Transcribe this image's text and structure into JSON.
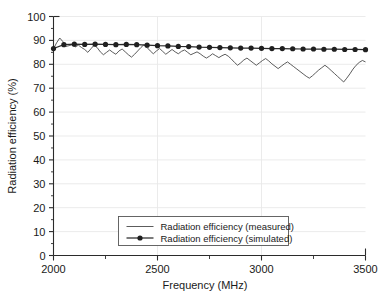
{
  "chart_data": {
    "type": "line",
    "title": "",
    "xlabel": "Frequency (MHz)",
    "ylabel": "Radiation efficiency (%)",
    "xlim": [
      2000,
      3500
    ],
    "ylim": [
      0,
      100
    ],
    "xticks": [
      2000,
      2500,
      3000,
      3500
    ],
    "xtick_labels": [
      "2000",
      "2500",
      "3000",
      "3500"
    ],
    "xminorticks": [
      2250,
      2750,
      3250
    ],
    "yticks": [
      0,
      10,
      20,
      30,
      40,
      50,
      60,
      70,
      80,
      90,
      100
    ],
    "ytick_labels": [
      "0",
      "10",
      "20",
      "30",
      "40",
      "50",
      "60",
      "70",
      "80",
      "90",
      "100"
    ],
    "grid": "light vertical gridlines at x majors, light horizontal gridlines at y majors",
    "legend_position": "lower center inside axes",
    "series": [
      {
        "name": "Radiation efficiency (measured)",
        "style": "thin solid line, no markers",
        "color": "#4a4a4a",
        "x": [
          2000,
          2015,
          2030,
          2045,
          2060,
          2075,
          2090,
          2105,
          2120,
          2135,
          2150,
          2165,
          2180,
          2195,
          2210,
          2225,
          2240,
          2255,
          2270,
          2285,
          2300,
          2315,
          2330,
          2345,
          2360,
          2375,
          2390,
          2405,
          2420,
          2435,
          2450,
          2465,
          2480,
          2495,
          2510,
          2525,
          2540,
          2555,
          2570,
          2585,
          2600,
          2615,
          2630,
          2645,
          2660,
          2675,
          2690,
          2705,
          2720,
          2735,
          2750,
          2765,
          2780,
          2795,
          2810,
          2825,
          2840,
          2855,
          2870,
          2885,
          2900,
          2915,
          2930,
          2945,
          2960,
          2975,
          2990,
          3005,
          3020,
          3035,
          3050,
          3065,
          3080,
          3095,
          3110,
          3125,
          3140,
          3155,
          3170,
          3185,
          3200,
          3215,
          3230,
          3245,
          3260,
          3275,
          3290,
          3305,
          3320,
          3335,
          3350,
          3365,
          3380,
          3395,
          3410,
          3425,
          3440,
          3455,
          3470,
          3485,
          3500
        ],
        "y": [
          86.5,
          89.0,
          91.0,
          89.5,
          87.5,
          87.8,
          88.2,
          87.3,
          88.0,
          87.0,
          86.2,
          85.0,
          86.5,
          88.0,
          87.0,
          85.2,
          84.0,
          85.0,
          86.0,
          85.0,
          84.2,
          85.6,
          86.4,
          85.2,
          84.0,
          83.0,
          84.2,
          85.6,
          87.0,
          88.2,
          87.0,
          85.6,
          84.4,
          85.6,
          86.6,
          85.4,
          84.2,
          85.2,
          86.2,
          85.2,
          84.4,
          85.4,
          86.0,
          85.0,
          84.0,
          84.6,
          85.2,
          84.4,
          83.4,
          82.6,
          83.4,
          84.4,
          83.6,
          82.8,
          83.6,
          84.2,
          83.4,
          82.2,
          80.8,
          79.6,
          80.6,
          81.8,
          82.6,
          81.6,
          80.6,
          79.6,
          80.6,
          81.6,
          82.4,
          81.4,
          80.2,
          79.2,
          78.2,
          79.2,
          80.2,
          81.0,
          80.0,
          79.0,
          78.0,
          77.0,
          76.0,
          75.0,
          74.2,
          75.2,
          76.4,
          77.6,
          78.6,
          79.6,
          78.6,
          77.4,
          76.2,
          75.0,
          73.8,
          72.6,
          74.2,
          76.0,
          78.0,
          79.6,
          80.8,
          81.6,
          81.0
        ]
      },
      {
        "name": "Radiation efficiency (simulated)",
        "style": "solid line with filled circular markers",
        "color": "#2a2a2a",
        "marker": "filled-circle",
        "x": [
          2000,
          2050,
          2100,
          2150,
          2200,
          2250,
          2300,
          2350,
          2400,
          2450,
          2500,
          2550,
          2600,
          2650,
          2700,
          2750,
          2800,
          2850,
          2900,
          2950,
          3000,
          3050,
          3100,
          3150,
          3200,
          3250,
          3300,
          3350,
          3400,
          3450,
          3500
        ],
        "y": [
          86.6,
          88.2,
          88.4,
          88.3,
          88.4,
          88.3,
          88.2,
          88.3,
          88.2,
          88.0,
          87.8,
          87.7,
          87.5,
          87.4,
          87.2,
          87.1,
          87.0,
          86.9,
          86.8,
          86.8,
          86.7,
          86.6,
          86.6,
          86.5,
          86.4,
          86.4,
          86.3,
          86.3,
          86.2,
          86.2,
          86.1
        ]
      }
    ],
    "legend_entries": [
      "Radiation efficiency (measured)",
      "Radiation efficiency (simulated)"
    ]
  }
}
